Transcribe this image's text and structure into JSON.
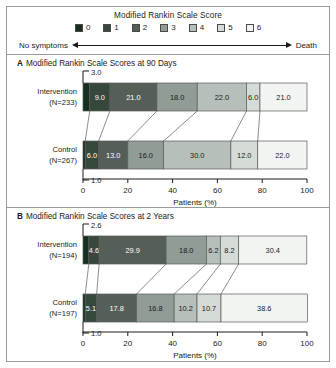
{
  "legend": {
    "title": "Modified Rankin Scale Score",
    "items": [
      {
        "label": "0",
        "color": "#14301f"
      },
      {
        "label": "1",
        "color": "#36473c"
      },
      {
        "label": "2",
        "color": "#555f58"
      },
      {
        "label": "3",
        "color": "#909c95"
      },
      {
        "label": "4",
        "color": "#b6bfb9"
      },
      {
        "label": "5",
        "color": "#d5dbd6"
      },
      {
        "label": "6",
        "color": "#f2f4f1"
      }
    ],
    "left_anchor": "No symptoms",
    "right_anchor": "Death"
  },
  "panels": [
    {
      "letter": "A",
      "title": "Modified Rankin Scale Scores at 90 Days",
      "xlabel": "Patients  (%)",
      "xticks": [
        "0",
        "20",
        "40",
        "60",
        "80",
        "100"
      ],
      "rows": [
        {
          "name": "Intervention",
          "n_label": "(N=233)",
          "lead_label": "3.0",
          "lead_value": 3.0,
          "values": [
            3.0,
            9.0,
            21.0,
            18.0,
            22.0,
            6.0,
            21.0
          ],
          "labels": [
            "3.0",
            "9.0",
            "21.0",
            "18.0",
            "22.0",
            "6.0",
            "21.0"
          ]
        },
        {
          "name": "Control",
          "n_label": "(N=267)",
          "lead_label": "1.0",
          "lead_value": 1.0,
          "values": [
            1.0,
            6.0,
            13.0,
            16.0,
            30.0,
            12.0,
            22.0
          ],
          "labels": [
            "1.0",
            "6.0",
            "13.0",
            "16.0",
            "30.0",
            "12.0",
            "22.0"
          ]
        }
      ]
    },
    {
      "letter": "B",
      "title": "Modified Rankin Scale Scores at 2 Years",
      "xlabel": "Patients  (%)",
      "xticks": [
        "0",
        "20",
        "40",
        "60",
        "80",
        "100"
      ],
      "rows": [
        {
          "name": "Intervention",
          "n_label": "(N=194)",
          "lead_label": "2.6",
          "lead_value": 2.6,
          "values": [
            2.6,
            4.6,
            29.9,
            18.0,
            6.2,
            8.2,
            30.4
          ],
          "labels": [
            "2.6",
            "4.6",
            "29.9",
            "18.0",
            "6.2",
            "8.2",
            "30.4"
          ]
        },
        {
          "name": "Control",
          "n_label": "(N=197)",
          "lead_label": "1.0",
          "lead_value": 1.0,
          "values": [
            1.0,
            5.1,
            17.8,
            16.8,
            10.2,
            10.7,
            38.6
          ],
          "labels": [
            "1.0",
            "5.1",
            "17.8",
            "16.8",
            "10.2",
            "10.7",
            "38.6"
          ]
        }
      ]
    }
  ],
  "chart_data": {
    "type": "bar",
    "title": "Modified Rankin Scale Score",
    "orientation": "horizontal",
    "stacked": true,
    "normalized_percent": true,
    "xlabel": "Patients  (%)",
    "ylabel": "",
    "xlim": [
      0,
      100
    ],
    "xticks": [
      0,
      20,
      40,
      60,
      80,
      100
    ],
    "grid": false,
    "legend_position": "top",
    "legend_entries": [
      "0",
      "1",
      "2",
      "3",
      "4",
      "5",
      "6"
    ],
    "annotations": [
      "No symptoms",
      "Death"
    ],
    "panels": [
      {
        "panel": "A",
        "subtitle": "Modified Rankin Scale Scores at 90 Days",
        "categories": [
          "Intervention (N=233)",
          "Control (N=267)"
        ],
        "series": [
          {
            "name": "0",
            "values": [
              3.0,
              1.0
            ]
          },
          {
            "name": "1",
            "values": [
              9.0,
              6.0
            ]
          },
          {
            "name": "2",
            "values": [
              21.0,
              13.0
            ]
          },
          {
            "name": "3",
            "values": [
              18.0,
              16.0
            ]
          },
          {
            "name": "4",
            "values": [
              22.0,
              30.0
            ]
          },
          {
            "name": "5",
            "values": [
              6.0,
              12.0
            ]
          },
          {
            "name": "6",
            "values": [
              21.0,
              22.0
            ]
          }
        ]
      },
      {
        "panel": "B",
        "subtitle": "Modified Rankin Scale Scores at 2 Years",
        "categories": [
          "Intervention (N=194)",
          "Control (N=197)"
        ],
        "series": [
          {
            "name": "0",
            "values": [
              2.6,
              1.0
            ]
          },
          {
            "name": "1",
            "values": [
              4.6,
              5.1
            ]
          },
          {
            "name": "2",
            "values": [
              29.9,
              17.8
            ]
          },
          {
            "name": "3",
            "values": [
              18.0,
              16.8
            ]
          },
          {
            "name": "4",
            "values": [
              6.2,
              10.2
            ]
          },
          {
            "name": "5",
            "values": [
              8.2,
              10.7
            ]
          },
          {
            "name": "6",
            "values": [
              30.4,
              38.6
            ]
          }
        ]
      }
    ]
  }
}
